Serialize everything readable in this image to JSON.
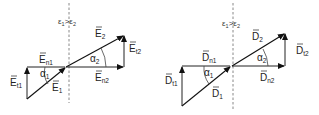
{
  "diagrams": [
    {
      "id": "electric-field",
      "condition": {
        "left": "ε",
        "left_sub": "1",
        "op": ">",
        "right": "ε",
        "right_sub": "2"
      },
      "labels": {
        "v1": {
          "sym": "E",
          "sub": "1"
        },
        "v2": {
          "sym": "E",
          "sub": "2"
        },
        "n1": {
          "sym": "E",
          "sub": "n1"
        },
        "n2": {
          "sym": "E",
          "sub": "n2"
        },
        "t1": {
          "sym": "E",
          "sub": "t1"
        },
        "t2": {
          "sym": "E",
          "sub": "t2"
        },
        "a1": {
          "sym": "α",
          "sub": "1"
        },
        "a2": {
          "sym": "α",
          "sub": "2"
        }
      }
    },
    {
      "id": "displacement-field",
      "condition": {
        "left": "ε",
        "left_sub": "1",
        "op": ">",
        "right": "ε",
        "right_sub": "2"
      },
      "labels": {
        "v1": {
          "sym": "D",
          "sub": "1"
        },
        "v2": {
          "sym": "D",
          "sub": "2"
        },
        "n1": {
          "sym": "D",
          "sub": "n1"
        },
        "n2": {
          "sym": "D",
          "sub": "n2"
        },
        "t1": {
          "sym": "D",
          "sub": "t1"
        },
        "t2": {
          "sym": "D",
          "sub": "t2"
        },
        "a1": {
          "sym": "α",
          "sub": "1"
        },
        "a2": {
          "sym": "α",
          "sub": "2"
        }
      }
    }
  ],
  "colors": {
    "ink": "#222222",
    "boundary": "#888888",
    "background": "#ffffff"
  }
}
